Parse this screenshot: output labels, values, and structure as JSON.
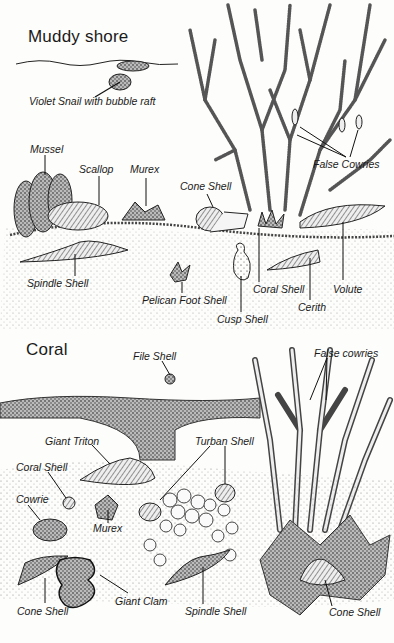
{
  "sections": {
    "muddy_shore": {
      "title": "Muddy shore",
      "labels": {
        "violet_snail": "Violet Snail with bubble raft",
        "mussel": "Mussel",
        "scallop": "Scallop",
        "murex": "Murex",
        "cone_shell": "Cone Shell",
        "false_cowries": "False Cowries",
        "spindle_shell": "Spindle Shell",
        "pelican_foot_shell": "Pelican Foot Shell",
        "cusp_shell": "Cusp Shell",
        "coral_shell": "Coral Shell",
        "cerith": "Cerith",
        "volute": "Volute"
      }
    },
    "coral": {
      "title": "Coral",
      "labels": {
        "file_shell": "File Shell",
        "false_cowries": "False cowries",
        "giant_triton": "Giant Triton",
        "turban_shell": "Turban Shell",
        "coral_shell": "Coral Shell",
        "cowrie": "Cowrie",
        "murex": "Murex",
        "cone_shell_left": "Cone Shell",
        "giant_clam": "Giant Clam",
        "spindle_shell": "Spindle Shell",
        "cone_shell_right": "Cone Shell"
      }
    }
  }
}
